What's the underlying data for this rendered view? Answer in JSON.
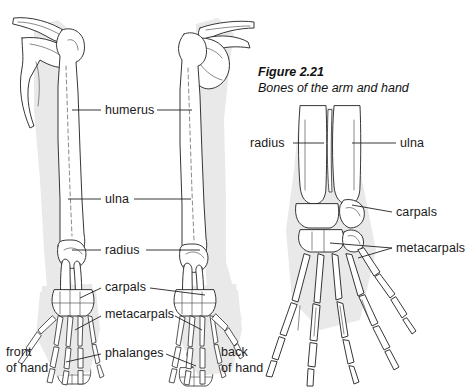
{
  "figure": {
    "number": "Figure 2.21",
    "caption": "Bones of the arm and hand"
  },
  "colors": {
    "ink": "#1a1a1a",
    "bone_outline": "#2b2b2b",
    "shadow": "#e9e9e9",
    "background": "#ffffff",
    "leader": "#222222"
  },
  "left_panel": {
    "name": "anterior-and-posterior-arm-views",
    "labels": [
      {
        "id": "humerus",
        "text": "humerus",
        "x": 105,
        "y": 103
      },
      {
        "id": "ulna",
        "text": "ulna",
        "x": 105,
        "y": 192
      },
      {
        "id": "radius",
        "text": "radius",
        "x": 105,
        "y": 243
      },
      {
        "id": "carpals",
        "text": "carpals",
        "x": 105,
        "y": 279
      },
      {
        "id": "metacarpals",
        "text": "metacarpals",
        "x": 105,
        "y": 306
      },
      {
        "id": "phalanges",
        "text": "phalanges",
        "x": 105,
        "y": 345
      }
    ],
    "view_notes": [
      {
        "id": "front-of-hand",
        "line1": "front",
        "line2": "of hand",
        "x": 6,
        "y": 345
      },
      {
        "id": "back-of-hand",
        "line1": "back",
        "line2": "of hand",
        "x": 221,
        "y": 345
      }
    ]
  },
  "right_panel": {
    "name": "hand-detail-view",
    "labels": [
      {
        "id": "radius",
        "text": "radius",
        "x": 250,
        "y": 137
      },
      {
        "id": "ulna",
        "text": "ulna",
        "x": 400,
        "y": 137
      },
      {
        "id": "carpals",
        "text": "carpals",
        "x": 396,
        "y": 208
      },
      {
        "id": "metacarpals",
        "text": "metacarpals",
        "x": 396,
        "y": 246
      }
    ]
  },
  "bone_names": [
    "humerus",
    "ulna",
    "radius",
    "carpals",
    "metacarpals",
    "phalanges"
  ]
}
